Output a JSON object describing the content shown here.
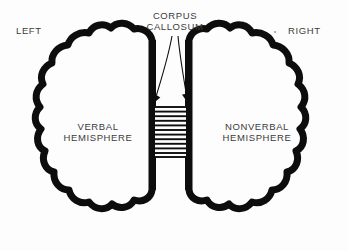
{
  "figure": {
    "kind": "brain-hemispheres-schematic",
    "background_color": "#fdfdfd",
    "ink_color": "#0d0d0d",
    "text_color": "#3b3b3b"
  },
  "labels": {
    "left": "LEFT",
    "right": "RIGHT",
    "corpus_callosum": "CORPUS\nCALLOSUM",
    "left_hemisphere": "VERBAL\nHEMISPHERE",
    "right_hemisphere": "NONVERBAL\nHEMISPHERE"
  },
  "corpus_callosum_band": {
    "stripe_count": 11,
    "top": 106,
    "bottom": 157,
    "left": 155,
    "right": 186
  },
  "annotation_arrows": [
    {
      "name": "arrow-to-left-edge",
      "from_x": 172,
      "from_y": 36,
      "to_x": 155,
      "to_y": 101
    },
    {
      "name": "arrow-to-right-edge",
      "from_x": 178,
      "from_y": 36,
      "to_x": 186,
      "to_y": 101
    }
  ]
}
